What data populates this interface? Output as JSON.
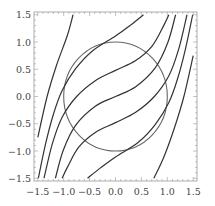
{
  "chart_data": {
    "type": "line",
    "title": "",
    "xlabel": "",
    "ylabel": "",
    "xlim": [
      -1.6,
      1.6
    ],
    "ylim": [
      -1.55,
      1.55
    ],
    "grid": false,
    "legend": null,
    "x_ticks": [
      -1.5,
      -1.0,
      -0.5,
      0.0,
      0.5,
      1.0,
      1.5
    ],
    "y_ticks": [
      -1.5,
      -1.0,
      -0.5,
      0.0,
      0.5,
      1.0,
      1.5
    ],
    "x_tick_labels": [
      "−1.5",
      "−1.0",
      "−0.5",
      "0.0",
      "0.5",
      "1.0",
      "1.5"
    ],
    "y_tick_labels": [
      "−1.5",
      "−1.0",
      "−0.5",
      "0.0",
      "0.5",
      "1.0",
      "1.5"
    ],
    "series": [
      {
        "name": "unit-circle",
        "shape": "circle",
        "center": [
          0,
          0
        ],
        "radius": 1.0,
        "color": "#666666"
      },
      {
        "name": "curve-1",
        "color": "#333333",
        "points": [
          [
            -1.5,
            -0.75
          ],
          [
            -1.32,
            0.0
          ],
          [
            -1.14,
            0.57
          ],
          [
            -0.93,
            1.12
          ],
          [
            -0.82,
            1.5
          ]
        ]
      },
      {
        "name": "curve-2",
        "color": "#333333",
        "points": [
          [
            -1.49,
            -1.5
          ],
          [
            -1.35,
            -0.87
          ],
          [
            -1.2,
            -0.33
          ],
          [
            -1.03,
            0.11
          ],
          [
            -0.77,
            0.51
          ],
          [
            -0.44,
            0.84
          ],
          [
            0.0,
            1.11
          ],
          [
            0.29,
            1.31
          ],
          [
            0.54,
            1.5
          ]
        ]
      },
      {
        "name": "curve-3",
        "color": "#333333",
        "points": [
          [
            -1.38,
            -1.5
          ],
          [
            -1.22,
            -0.87
          ],
          [
            -1.03,
            -0.38
          ],
          [
            -0.75,
            0.0
          ],
          [
            -0.39,
            0.29
          ],
          [
            0.0,
            0.48
          ],
          [
            0.39,
            0.66
          ],
          [
            0.71,
            0.93
          ],
          [
            0.93,
            1.3
          ],
          [
            1.03,
            1.5
          ]
        ]
      },
      {
        "name": "curve-4-center",
        "color": "#333333",
        "points": [
          [
            -1.16,
            -1.5
          ],
          [
            -1.01,
            -0.99
          ],
          [
            -0.77,
            -0.53
          ],
          [
            -0.39,
            -0.18
          ],
          [
            0.0,
            0.0
          ],
          [
            0.39,
            0.18
          ],
          [
            0.77,
            0.53
          ],
          [
            1.01,
            0.99
          ],
          [
            1.16,
            1.5
          ]
        ]
      },
      {
        "name": "curve-5",
        "color": "#333333",
        "points": [
          [
            -1.03,
            -1.5
          ],
          [
            -0.93,
            -1.3
          ],
          [
            -0.71,
            -0.93
          ],
          [
            -0.39,
            -0.66
          ],
          [
            0.0,
            -0.48
          ],
          [
            0.39,
            -0.29
          ],
          [
            0.75,
            0.0
          ],
          [
            1.03,
            0.38
          ],
          [
            1.22,
            0.87
          ],
          [
            1.38,
            1.5
          ]
        ]
      },
      {
        "name": "curve-6",
        "color": "#333333",
        "points": [
          [
            -0.54,
            -1.5
          ],
          [
            -0.29,
            -1.31
          ],
          [
            0.0,
            -1.11
          ],
          [
            0.44,
            -0.84
          ],
          [
            0.77,
            -0.51
          ],
          [
            1.03,
            -0.11
          ],
          [
            1.2,
            0.33
          ],
          [
            1.35,
            0.87
          ],
          [
            1.49,
            1.5
          ]
        ]
      },
      {
        "name": "curve-7",
        "color": "#333333",
        "points": [
          [
            0.74,
            -1.5
          ],
          [
            0.93,
            -1.12
          ],
          [
            1.14,
            -0.57
          ],
          [
            1.32,
            0.0
          ],
          [
            1.5,
            0.75
          ]
        ]
      }
    ]
  }
}
